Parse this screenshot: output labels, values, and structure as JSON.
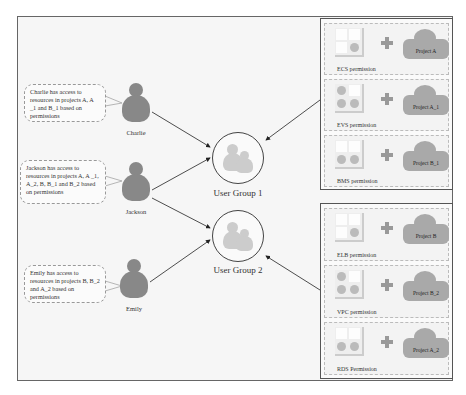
{
  "users": [
    {
      "name": "Charlie",
      "bubble": "Charlie has access to resources in projects A, A _1 and B_1 based on permissions"
    },
    {
      "name": "Jackson",
      "bubble": "Jackson has access to resources in projects A, A _1, A_2, B, B_1 and B_2 based on permissions"
    },
    {
      "name": "Emily",
      "bubble": "Emily has access to resources in projects B, B_2 and A_2 based on permissions"
    }
  ],
  "groups": [
    {
      "label": "User Group 1"
    },
    {
      "label": "User Group 2"
    }
  ],
  "group1_permissions": [
    {
      "permission": "ECS permission",
      "project": "Project A",
      "icon": "grid-one-dot"
    },
    {
      "permission": "EVS permission",
      "project": "Project A_1",
      "icon": "grid-three-dots"
    },
    {
      "permission": "BMS permission",
      "project": "Project B_1",
      "icon": "grid-two-dots"
    }
  ],
  "group2_permissions": [
    {
      "permission": "ELB permission",
      "project": "Project B",
      "icon": "grid-one-dot"
    },
    {
      "permission": "VPC permission",
      "project": "Project B_2",
      "icon": "grid-three-dots"
    },
    {
      "permission": "RDS Permission",
      "project": "Project A_2",
      "icon": "grid-two-dots"
    }
  ],
  "colors": {
    "person": "#888888",
    "group_icon": "#cccccc",
    "cloud": "#a9a9a9",
    "frame": "#666666"
  }
}
